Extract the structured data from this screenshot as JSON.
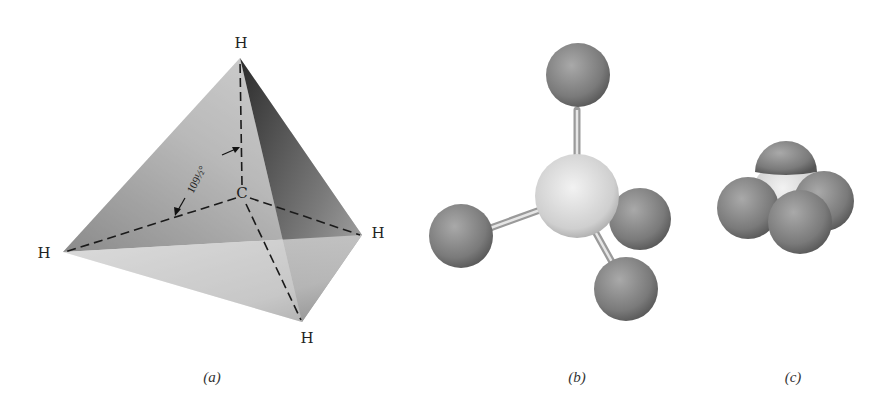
{
  "figure": {
    "panels": [
      {
        "id": "a",
        "caption": "(a)",
        "description": "Tetrahedron with central carbon and four hydrogens at vertices",
        "atoms": {
          "top": "H",
          "left": "H",
          "right": "H",
          "bottom": "H",
          "center": "C"
        },
        "angle_label": "109½°"
      },
      {
        "id": "b",
        "caption": "(b)",
        "description": "Ball-and-stick model"
      },
      {
        "id": "c",
        "caption": "(c)",
        "description": "Space-filling model"
      }
    ],
    "colors": {
      "hydrogen": "#7a7a7a",
      "carbon": "#d9d9d9",
      "bond": "#bdbdbd"
    }
  }
}
